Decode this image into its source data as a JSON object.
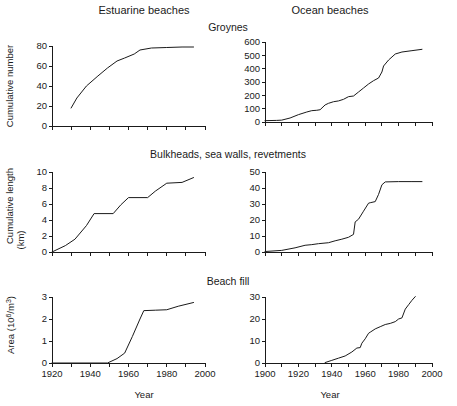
{
  "figure": {
    "column_headers": [
      "Estuarine beaches",
      "Ocean beaches"
    ],
    "row_titles": [
      "Groynes",
      "Bulkheads, sea walls, revetments",
      "Beach fill"
    ],
    "xlabel": "Year",
    "axis_color": "#1a1a1a",
    "line_color": "#1a1a1a"
  },
  "chart_data": [
    {
      "type": "line",
      "panel": "top-left",
      "title": "Groynes",
      "column": "Estuarine beaches",
      "xlabel": "Year",
      "ylabel": "Cumulative number",
      "xlim": [
        1920,
        2000
      ],
      "ylim": [
        0,
        80
      ],
      "xticks": [
        1920,
        1930,
        1940,
        1950,
        1960,
        1970,
        1980,
        1990,
        2000
      ],
      "xticklabels": [
        "",
        "",
        "",
        "",
        "",
        "",
        "",
        "",
        ""
      ],
      "yticks": [
        0,
        20,
        40,
        60,
        80
      ],
      "yticklabels": [
        "0",
        "20",
        "40",
        "60",
        "80"
      ],
      "grid": false,
      "legend": "none",
      "x": [
        1930,
        1933,
        1938,
        1944,
        1949,
        1954,
        1958,
        1963,
        1966,
        1972,
        1980,
        1988,
        1994
      ],
      "y": [
        18,
        28,
        40,
        50,
        58,
        65,
        68,
        72,
        76,
        78,
        78.5,
        79,
        79
      ]
    },
    {
      "type": "line",
      "panel": "top-right",
      "title": "Groynes",
      "column": "Ocean beaches",
      "xlabel": "Year",
      "ylabel": "Cumulative number",
      "xlim": [
        1900,
        2000
      ],
      "ylim": [
        0,
        600
      ],
      "xticks": [
        1900,
        1910,
        1920,
        1930,
        1940,
        1950,
        1960,
        1970,
        1980,
        1990,
        2000
      ],
      "xticklabels": [
        "",
        "",
        "",
        "",
        "",
        "",
        "",
        "",
        "",
        "",
        ""
      ],
      "yticks": [
        0,
        100,
        200,
        300,
        400,
        500,
        600
      ],
      "yticklabels": [
        "0",
        "100",
        "200",
        "300",
        "400",
        "500",
        "600"
      ],
      "grid": false,
      "legend": "none",
      "x": [
        1900,
        1907,
        1910,
        1915,
        1920,
        1925,
        1928,
        1931,
        1933,
        1936,
        1938,
        1941,
        1944,
        1947,
        1950,
        1953,
        1956,
        1959,
        1962,
        1965,
        1968,
        1970,
        1971,
        1974,
        1978,
        1982,
        1988,
        1994
      ],
      "y": [
        10,
        12,
        14,
        30,
        55,
        75,
        85,
        88,
        92,
        128,
        140,
        152,
        158,
        170,
        190,
        195,
        225,
        255,
        285,
        310,
        330,
        375,
        420,
        465,
        510,
        525,
        535,
        545
      ]
    },
    {
      "type": "line",
      "panel": "middle-left",
      "title": "Bulkheads, sea walls, revetments",
      "column": "Estuarine beaches",
      "xlabel": "Year",
      "ylabel": "Cumulative length (km)",
      "xlim": [
        1920,
        2000
      ],
      "ylim": [
        0,
        10
      ],
      "xticks": [
        1920,
        1930,
        1940,
        1950,
        1960,
        1970,
        1980,
        1990,
        2000
      ],
      "xticklabels": [
        "",
        "",
        "",
        "",
        "",
        "",
        "",
        "",
        ""
      ],
      "yticks": [
        0,
        2,
        4,
        6,
        8,
        10
      ],
      "yticklabels": [
        "0",
        "2",
        "4",
        "6",
        "8",
        "10"
      ],
      "grid": false,
      "legend": "none",
      "x": [
        1920,
        1927,
        1932,
        1938,
        1942,
        1952,
        1956,
        1960,
        1970,
        1974,
        1980,
        1988,
        1994
      ],
      "y": [
        0,
        0.8,
        1.6,
        3.3,
        4.8,
        4.8,
        5.9,
        6.8,
        6.8,
        7.6,
        8.6,
        8.7,
        9.3
      ]
    },
    {
      "type": "line",
      "panel": "middle-right",
      "title": "Bulkheads, sea walls, revetments",
      "column": "Ocean beaches",
      "xlabel": "Year",
      "ylabel": "Cumulative length (km)",
      "xlim": [
        1900,
        2000
      ],
      "ylim": [
        0,
        50
      ],
      "xticks": [
        1900,
        1910,
        1920,
        1930,
        1940,
        1950,
        1960,
        1970,
        1980,
        1990,
        2000
      ],
      "xticklabels": [
        "",
        "",
        "",
        "",
        "",
        "",
        "",
        "",
        "",
        "",
        ""
      ],
      "yticks": [
        0,
        10,
        20,
        30,
        40,
        50
      ],
      "yticklabels": [
        "0",
        "10",
        "20",
        "30",
        "40",
        "50"
      ],
      "grid": false,
      "legend": "none",
      "x": [
        1900,
        1910,
        1918,
        1924,
        1928,
        1932,
        1938,
        1942,
        1946,
        1950,
        1953,
        1954,
        1956,
        1959,
        1962,
        1963,
        1966,
        1968,
        1970,
        1972,
        1980,
        1988,
        1994
      ],
      "y": [
        0.3,
        1.0,
        2.6,
        4.2,
        4.6,
        5.2,
        5.8,
        7.0,
        8.0,
        9.2,
        11.0,
        18.8,
        20.5,
        25.5,
        30.5,
        30.8,
        31.5,
        36.0,
        42.0,
        43.8,
        44.0,
        44.0,
        44.0
      ]
    },
    {
      "type": "line",
      "panel": "bottom-left",
      "title": "Beach fill",
      "column": "Estuarine beaches",
      "xlabel": "Year",
      "ylabel": "Area (10^6/m^3)",
      "xlim": [
        1920,
        2000
      ],
      "ylim": [
        0,
        3
      ],
      "xticks": [
        1920,
        1930,
        1940,
        1950,
        1960,
        1970,
        1980,
        1990,
        2000
      ],
      "xticklabels": [
        "1920",
        "",
        "1940",
        "",
        "1960",
        "",
        "1980",
        "",
        "2000"
      ],
      "yticks": [
        0,
        1,
        2,
        3
      ],
      "yticklabels": [
        "0",
        "1",
        "2",
        "3"
      ],
      "grid": false,
      "legend": "none",
      "x": [
        1920,
        1949,
        1954,
        1958,
        1962,
        1966,
        1968,
        1974,
        1980,
        1986,
        1994
      ],
      "y": [
        0,
        0,
        0.2,
        0.45,
        1.2,
        2.0,
        2.38,
        2.4,
        2.42,
        2.58,
        2.75
      ]
    },
    {
      "type": "line",
      "panel": "bottom-right",
      "title": "Beach fill",
      "column": "Ocean beaches",
      "xlabel": "Year",
      "ylabel": "Area (10^6/m^3)",
      "xlim": [
        1900,
        2000
      ],
      "ylim": [
        0,
        30
      ],
      "xticks": [
        1900,
        1910,
        1920,
        1930,
        1940,
        1950,
        1960,
        1970,
        1980,
        1990,
        2000
      ],
      "xticklabels": [
        "1900",
        "",
        "1920",
        "",
        "1940",
        "",
        "1960",
        "",
        "1980",
        "",
        "2000"
      ],
      "yticks": [
        0,
        10,
        20,
        30
      ],
      "yticklabels": [
        "0",
        "10",
        "20",
        "30"
      ],
      "grid": false,
      "legend": "none",
      "x": [
        1936,
        1940,
        1944,
        1948,
        1952,
        1955,
        1957,
        1958,
        1960,
        1962,
        1963,
        1966,
        1969,
        1972,
        1975,
        1978,
        1980,
        1982,
        1984,
        1986,
        1988,
        1990
      ],
      "y": [
        0.2,
        1.2,
        2.2,
        3.2,
        5.0,
        6.8,
        7.0,
        9.0,
        11.0,
        13.5,
        14.0,
        15.5,
        16.5,
        17.5,
        18.0,
        18.8,
        20.0,
        20.5,
        24.5,
        26.5,
        28.5,
        30.2
      ]
    }
  ]
}
